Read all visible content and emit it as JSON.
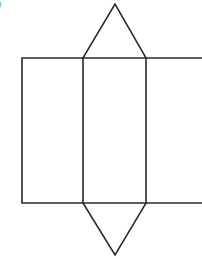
{
  "figure": {
    "label_fragment": ")",
    "background_color": "#ffffff",
    "stroke_color": "#2a2a2a",
    "stroke_width": 1.6,
    "canvas": {
      "width": 202,
      "height": 259
    }
  },
  "chart_data": {
    "type": "diagram",
    "xlabel": "",
    "ylabel": "",
    "xlim": [
      0,
      202
    ],
    "ylim": [
      0,
      259
    ],
    "grid": false,
    "legend": null,
    "shapes": [
      {
        "name": "left-rectangle-face",
        "type": "polyline",
        "closed": false,
        "points": [
          [
            83,
            58
          ],
          [
            22,
            58
          ],
          [
            22,
            203
          ],
          [
            83,
            203
          ]
        ]
      },
      {
        "name": "middle-rectangle-face",
        "type": "polygon",
        "closed": true,
        "points": [
          [
            83,
            58
          ],
          [
            146,
            58
          ],
          [
            146,
            203
          ],
          [
            83,
            203
          ]
        ]
      },
      {
        "name": "right-rectangle-face-cropped",
        "type": "polyline",
        "closed": false,
        "points": [
          [
            146,
            58
          ],
          [
            202,
            58
          ]
        ]
      },
      {
        "name": "right-rectangle-face-bottom-cropped",
        "type": "polyline",
        "closed": false,
        "points": [
          [
            146,
            203
          ],
          [
            202,
            203
          ]
        ]
      },
      {
        "name": "top-triangle-face",
        "type": "polyline",
        "closed": false,
        "points": [
          [
            83,
            58
          ],
          [
            115,
            4
          ],
          [
            146,
            58
          ]
        ]
      },
      {
        "name": "bottom-triangle-face",
        "type": "polyline",
        "closed": false,
        "points": [
          [
            83,
            203
          ],
          [
            115,
            255
          ],
          [
            146,
            203
          ]
        ]
      }
    ],
    "vertices": [
      {
        "name": "rect-top-left",
        "x": 22,
        "y": 58
      },
      {
        "name": "rect-bottom-left",
        "x": 22,
        "y": 203
      },
      {
        "name": "inner-top-left",
        "x": 83,
        "y": 58
      },
      {
        "name": "inner-bottom-left",
        "x": 83,
        "y": 203
      },
      {
        "name": "inner-top-right",
        "x": 146,
        "y": 58
      },
      {
        "name": "inner-bottom-right",
        "x": 146,
        "y": 203
      },
      {
        "name": "top-triangle-apex",
        "x": 115,
        "y": 4
      },
      {
        "name": "bottom-triangle-apex",
        "x": 115,
        "y": 255
      }
    ]
  }
}
